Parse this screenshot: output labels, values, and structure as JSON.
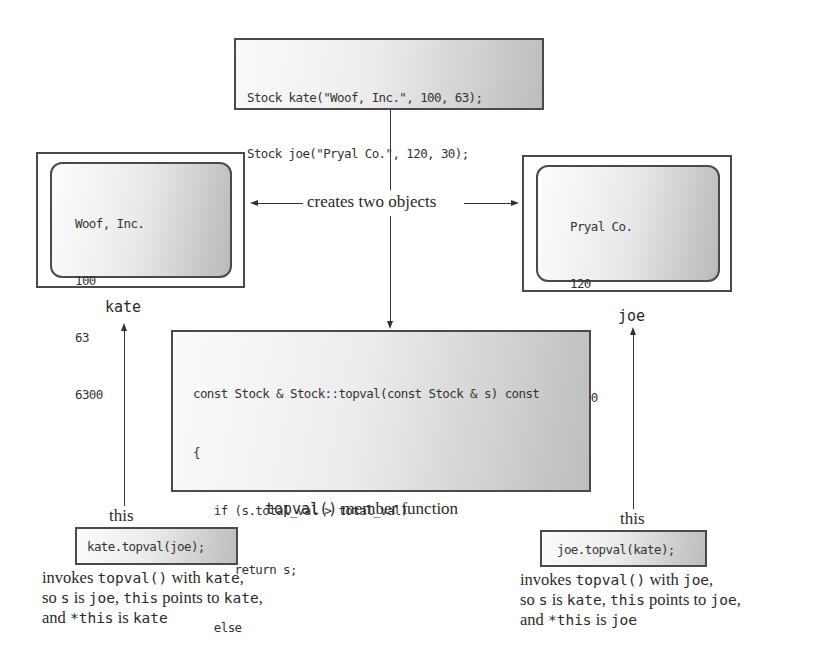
{
  "declaration_box": {
    "lines": [
      "Stock kate(\"Woof, Inc.\", 100, 63);",
      "Stock joe(\"Pryal Co.\", 120, 30);"
    ]
  },
  "connector_label": "creates two objects",
  "objects": {
    "kate": {
      "name": "kate",
      "fields": [
        "Woof, Inc.",
        "100",
        "63",
        "6300"
      ]
    },
    "joe": {
      "name": "joe",
      "fields": [
        "Pryal Co.",
        "120",
        "30",
        "3600"
      ]
    }
  },
  "member_function": {
    "lines": [
      "const Stock & Stock::topval(const Stock & s) const",
      "{",
      "   if (s.total_val > total_val)",
      "      return s;",
      "   else",
      "      return *this;",
      "}"
    ],
    "caption_code": "topval()",
    "caption_text": " member function"
  },
  "calls": {
    "left": {
      "this_label": "this",
      "call": "kate.topval(joe);",
      "caption": [
        [
          {
            "t": "invokes ",
            "m": false
          },
          {
            "t": "topval()",
            "m": true
          },
          {
            "t": " with ",
            "m": false
          },
          {
            "t": "kate",
            "m": true
          },
          {
            "t": ",",
            "m": false
          }
        ],
        [
          {
            "t": "so ",
            "m": false
          },
          {
            "t": "s",
            "m": true
          },
          {
            "t": " is ",
            "m": false
          },
          {
            "t": "joe",
            "m": true
          },
          {
            "t": ", ",
            "m": false
          },
          {
            "t": "this",
            "m": true
          },
          {
            "t": " points to ",
            "m": false
          },
          {
            "t": "kate",
            "m": true
          },
          {
            "t": ",",
            "m": false
          }
        ],
        [
          {
            "t": "and ",
            "m": false
          },
          {
            "t": "*this",
            "m": true
          },
          {
            "t": " is ",
            "m": false
          },
          {
            "t": "kate",
            "m": true
          }
        ]
      ]
    },
    "right": {
      "this_label": "this",
      "call": "joe.topval(kate);",
      "caption": [
        [
          {
            "t": "invokes ",
            "m": false
          },
          {
            "t": "topval()",
            "m": true
          },
          {
            "t": " with ",
            "m": false
          },
          {
            "t": "joe",
            "m": true
          },
          {
            "t": ",",
            "m": false
          }
        ],
        [
          {
            "t": "so ",
            "m": false
          },
          {
            "t": "s",
            "m": true
          },
          {
            "t": " is ",
            "m": false
          },
          {
            "t": "kate",
            "m": true
          },
          {
            "t": ", ",
            "m": false
          },
          {
            "t": "this",
            "m": true
          },
          {
            "t": " points to ",
            "m": false
          },
          {
            "t": "joe",
            "m": true
          },
          {
            "t": ",",
            "m": false
          }
        ],
        [
          {
            "t": "and ",
            "m": false
          },
          {
            "t": "*this",
            "m": true
          },
          {
            "t": " is ",
            "m": false
          },
          {
            "t": "joe",
            "m": true
          }
        ]
      ]
    }
  }
}
